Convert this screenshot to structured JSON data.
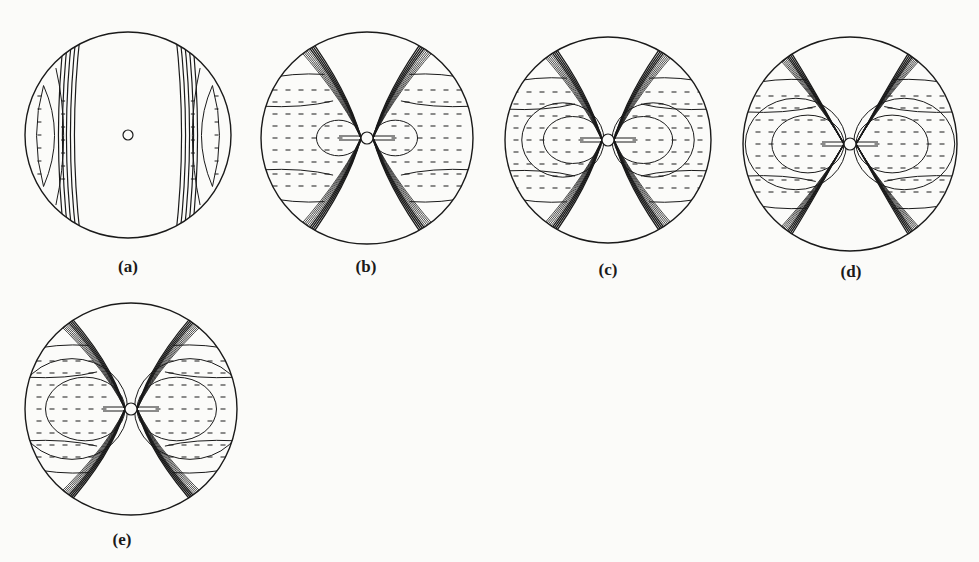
{
  "figure": {
    "stroke_color": "#1a1a1a",
    "background_color": "#fbfbf9",
    "panels": [
      {
        "id": "a",
        "label": "(a)",
        "cx": 128,
        "cy": 135,
        "r": 103,
        "hole_r": 5,
        "pattern": "vertical-bands",
        "label_x": 128,
        "label_y": 257
      },
      {
        "id": "b",
        "label": "(b)",
        "cx": 367,
        "cy": 138,
        "r": 106,
        "hole_r": 6,
        "pattern": "hourglass",
        "spread": 0.62,
        "inner_lobe": 0.28,
        "label_x": 366,
        "label_y": 257
      },
      {
        "id": "c",
        "label": "(c)",
        "cx": 608,
        "cy": 140,
        "r": 103,
        "hole_r": 6,
        "pattern": "hourglass",
        "spread": 0.62,
        "inner_lobe": 0.38,
        "label_x": 608,
        "label_y": 260
      },
      {
        "id": "d",
        "label": "(d)",
        "cx": 850,
        "cy": 144,
        "r": 107,
        "hole_r": 6,
        "pattern": "hourglass-wavy",
        "spread": 0.68,
        "inner_lobe": 0.45,
        "label_x": 851,
        "label_y": 262
      },
      {
        "id": "e",
        "label": "(e)",
        "cx": 131,
        "cy": 409,
        "r": 106,
        "hole_r": 6,
        "pattern": "hourglass-lobes",
        "spread": 0.72,
        "inner_lobe": 0.5,
        "label_x": 122,
        "label_y": 530
      }
    ]
  }
}
